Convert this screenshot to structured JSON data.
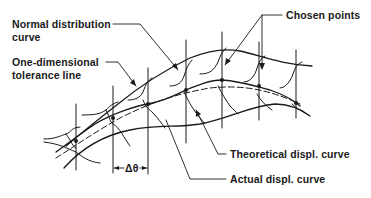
{
  "diagram": {
    "labels": {
      "normal_distribution_line1": "Normal distribution",
      "normal_distribution_line2": "curve",
      "tolerance_line1": "One-dimensional",
      "tolerance_line2": "tolerance line",
      "chosen_points": "Chosen points",
      "theoretical_curve": "Theoretical displ. curve",
      "actual_curve": "Actual displ. curve",
      "delta_theta": "Δθ"
    },
    "colors": {
      "ink": "#1a1a1a",
      "background": "#ffffff"
    }
  }
}
